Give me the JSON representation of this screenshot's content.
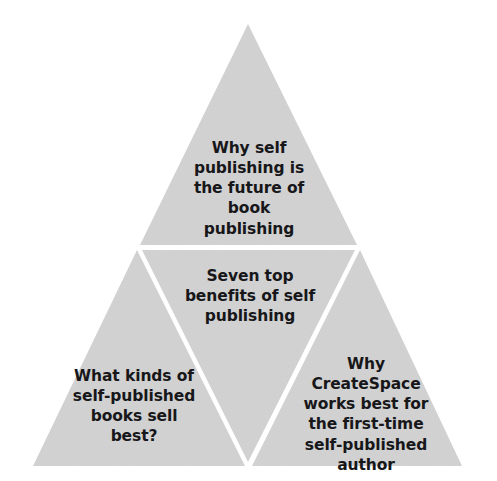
{
  "diagram": {
    "type": "pyramid",
    "segment_count": 4,
    "colors": {
      "fill": "#d2d2d2",
      "divider": "#ffffff",
      "text": "#17171a",
      "background": "#ffffff"
    },
    "segments": [
      {
        "id": "top",
        "position": "apex",
        "text": "Why self\npublishing is\nthe future of\nbook\npublishing"
      },
      {
        "id": "middle",
        "position": "center-inverted",
        "text": "Seven top\nbenefits of self\npublishing"
      },
      {
        "id": "bottom-left",
        "position": "base-left",
        "text": "What kinds of\nself-published\nbooks sell\nbest?"
      },
      {
        "id": "bottom-right",
        "position": "base-right",
        "text": "Why\nCreateSpace\nworks best for\nthe first-time\nself-published\nauthor"
      }
    ]
  }
}
